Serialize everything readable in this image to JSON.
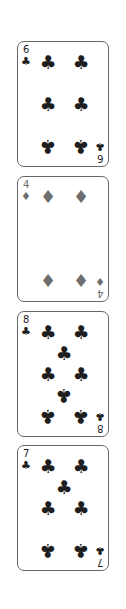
{
  "cards": [
    {
      "rank": "6",
      "suit": "clubs",
      "glyph": "♣",
      "color": "#1e1e1e"
    },
    {
      "rank": "4",
      "suit": "diamonds",
      "glyph": "♦",
      "color": "#6e6e6e"
    },
    {
      "rank": "8",
      "suit": "clubs",
      "glyph": "♣",
      "color": "#1e1e1e"
    },
    {
      "rank": "7",
      "suit": "clubs",
      "glyph": "♣",
      "color": "#1e1e1e"
    }
  ]
}
